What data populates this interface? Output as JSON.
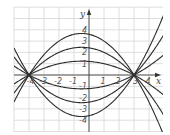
{
  "chart_data": {
    "type": "line",
    "title": "",
    "xlabel": "x",
    "ylabel": "y",
    "xlim": [
      -5,
      5
    ],
    "ylim": [
      -5,
      6
    ],
    "grid": true,
    "legend": null,
    "x_ticks": [
      -4,
      -3,
      -2,
      -1,
      1,
      2,
      3,
      4
    ],
    "y_ticks": [
      4,
      3,
      2,
      1,
      -1,
      -2,
      -3,
      -4
    ],
    "x_tick_labels": [
      "-4",
      "-3",
      "-2",
      "-1",
      "1",
      "2",
      "3",
      "4"
    ],
    "y_tick_labels": [
      "4",
      "3",
      "2",
      "1",
      "-1",
      "-2",
      "-3",
      "-4"
    ],
    "common_roots": [
      -4,
      3
    ],
    "series": [
      {
        "name": "y = -0.3(x+4)(x-3)",
        "a": -0.3,
        "vertex": [
          -0.5,
          3.675
        ]
      },
      {
        "name": "y = -0.2(x+4)(x-3)",
        "a": -0.2,
        "vertex": [
          -0.5,
          2.45
        ]
      },
      {
        "name": "y = -0.1(x+4)(x-3)",
        "a": -0.1,
        "vertex": [
          -0.5,
          1.225
        ]
      },
      {
        "name": "y = 0.1(x+4)(x-3)",
        "a": 0.1,
        "vertex": [
          -0.5,
          -1.225
        ]
      },
      {
        "name": "y = 0.2(x+4)(x-3)",
        "a": 0.2,
        "vertex": [
          -0.5,
          -2.45
        ]
      },
      {
        "name": "y = 0.3(x+4)(x-3)",
        "a": 0.3,
        "vertex": [
          -0.5,
          -3.675
        ]
      }
    ]
  },
  "layout": {
    "origin_px": [
      89,
      75
    ],
    "unit_x_px": 15,
    "unit_y_px": 11.3,
    "plot_px": {
      "left": 14,
      "top": 7,
      "right": 163,
      "bottom": 132
    },
    "colors": {
      "grid": "#d6d6d6",
      "axis": "#444444",
      "curve": "#2b2b2b",
      "label": "#555555"
    }
  }
}
